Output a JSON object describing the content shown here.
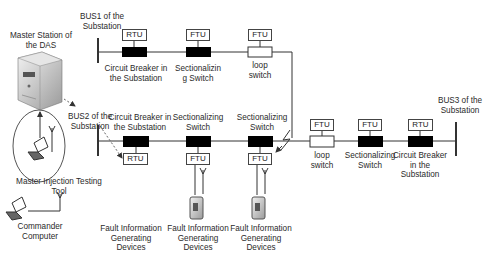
{
  "diagram": {
    "master_station_label": [
      "Master Station of",
      "the DAS"
    ],
    "bus1_label": [
      "BUS1 of the",
      "Substation"
    ],
    "bus2_label": [
      "BUS2 of the",
      "Substation"
    ],
    "bus3_label": [
      "BUS3 of the",
      "Substation"
    ],
    "injection_tool_label": [
      "Master Injection Testing",
      "Tool"
    ],
    "commander_label": [
      "Commander",
      "Computer"
    ],
    "line1": {
      "units": [
        {
          "box": "RTU",
          "type": "breaker",
          "label": [
            "Circuit Breaker in",
            "the Substation"
          ]
        },
        {
          "box": "FTU",
          "type": "sectionalizing",
          "label": [
            "Sectionalizin",
            "g Switch"
          ]
        },
        {
          "box": "FTU",
          "type": "loop",
          "label": [
            "loop",
            "switch"
          ]
        }
      ]
    },
    "line2": {
      "units": [
        {
          "box": "RTU",
          "type": "breaker",
          "label": [
            "Circuit Breaker in",
            "the Substation"
          ]
        },
        {
          "box": "FTU",
          "type": "sectionalizing",
          "label": [
            "Sectionalizing",
            "Switch"
          ]
        },
        {
          "box": "FTU",
          "type": "sectionalizing",
          "label": [
            "Sectionalizing",
            "Switch"
          ]
        }
      ]
    },
    "line3": {
      "units": [
        {
          "box": "FTU",
          "type": "loop",
          "label": [
            "loop",
            "switch"
          ]
        },
        {
          "box": "FTU",
          "type": "sectionalizing",
          "label": [
            "Sectionalizing",
            "Switch"
          ]
        },
        {
          "box": "RTU",
          "type": "breaker",
          "label": [
            "Circuit Breaker",
            "in the",
            "Substation"
          ]
        }
      ]
    },
    "fault_devices_label": [
      "Fault Information",
      "Generating",
      "Devices"
    ],
    "colors": {
      "switch_closed": "#000000",
      "switch_open": "#ffffff",
      "line": "#333333"
    }
  }
}
